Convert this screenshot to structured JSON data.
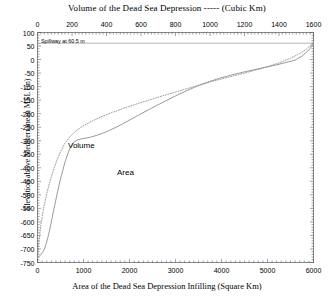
{
  "chart_data": {
    "type": "line",
    "title": "Volume of the Dead Sea Depression ----- (Cubic Km)",
    "xlabel_top": "Volume of the Dead Sea Depression ----- (Cubic Km)",
    "xlabel_bottom": "Area of the Dead Sea Depression Infilling (Square Km)",
    "ylabel": "Elevation above Mediterranean MSL (m)",
    "ylim": [
      -750,
      100
    ],
    "xlim_top": [
      0,
      1600
    ],
    "xlim_bottom": [
      0,
      6000
    ],
    "grid": false,
    "legend_position": "inline-annotations",
    "yticks": [
      100,
      50,
      0,
      -50,
      -100,
      -150,
      -200,
      -250,
      -300,
      -350,
      -400,
      -450,
      -500,
      -550,
      -600,
      -650,
      -700,
      -750
    ],
    "ytick_labels": [
      "100",
      "50",
      "0",
      "-50",
      "-100",
      "-150",
      "-200",
      "-250",
      "-300",
      "-350",
      "-400",
      "-450",
      "-500",
      "-550",
      "-600",
      "-650",
      "-700",
      "-750"
    ],
    "xticks_top": [
      0,
      200,
      400,
      600,
      800,
      1000,
      1200,
      1400,
      1600
    ],
    "xtick_labels_top": [
      "0",
      "200",
      "400",
      "600",
      "800",
      "1000",
      "1200",
      "1400",
      "1600"
    ],
    "xticks_bottom": [
      0,
      1000,
      2000,
      3000,
      4000,
      5000,
      6000
    ],
    "xtick_labels_bottom": [
      "0",
      "1000",
      "2000",
      "3000",
      "4000",
      "5000",
      "6000"
    ],
    "annotations": [
      {
        "name": "spillway-line",
        "text": "Spillway at 60.5 m",
        "elevation": 60.5,
        "style": "horizontal-line"
      }
    ],
    "series": [
      {
        "name": "Volume",
        "label": "Volume",
        "style": "dotted",
        "color": "#808080",
        "x_axis": "top",
        "x_units": "Cubic Km",
        "points": [
          [
            0,
            -730
          ],
          [
            2,
            -720
          ],
          [
            5,
            -700
          ],
          [
            9,
            -670
          ],
          [
            14,
            -640
          ],
          [
            20,
            -610
          ],
          [
            27,
            -580
          ],
          [
            35,
            -550
          ],
          [
            45,
            -520
          ],
          [
            56,
            -490
          ],
          [
            68,
            -460
          ],
          [
            82,
            -430
          ],
          [
            97,
            -400
          ],
          [
            114,
            -370
          ],
          [
            134,
            -340
          ],
          [
            158,
            -310
          ],
          [
            188,
            -285
          ],
          [
            225,
            -262
          ],
          [
            270,
            -243
          ],
          [
            320,
            -226
          ],
          [
            375,
            -210
          ],
          [
            435,
            -195
          ],
          [
            500,
            -180
          ],
          [
            570,
            -165
          ],
          [
            645,
            -150
          ],
          [
            720,
            -135
          ],
          [
            800,
            -120
          ],
          [
            880,
            -105
          ],
          [
            960,
            -90
          ],
          [
            1040,
            -76
          ],
          [
            1120,
            -63
          ],
          [
            1200,
            -50
          ],
          [
            1275,
            -37
          ],
          [
            1345,
            -24
          ],
          [
            1410,
            -10
          ],
          [
            1470,
            6
          ],
          [
            1520,
            22
          ],
          [
            1558,
            38
          ],
          [
            1582,
            52
          ],
          [
            1596,
            60.5
          ]
        ]
      },
      {
        "name": "Area",
        "label": "Area",
        "style": "solid",
        "color": "#808080",
        "x_axis": "bottom",
        "x_units": "Square Km",
        "points": [
          [
            0,
            -730
          ],
          [
            30,
            -728
          ],
          [
            70,
            -722
          ],
          [
            110,
            -712
          ],
          [
            150,
            -700
          ],
          [
            190,
            -680
          ],
          [
            230,
            -655
          ],
          [
            270,
            -625
          ],
          [
            310,
            -592
          ],
          [
            350,
            -558
          ],
          [
            395,
            -522
          ],
          [
            440,
            -485
          ],
          [
            490,
            -448
          ],
          [
            545,
            -412
          ],
          [
            600,
            -378
          ],
          [
            660,
            -348
          ],
          [
            720,
            -322
          ],
          [
            790,
            -305
          ],
          [
            870,
            -297
          ],
          [
            960,
            -293
          ],
          [
            1060,
            -290
          ],
          [
            1170,
            -286
          ],
          [
            1290,
            -280
          ],
          [
            1420,
            -272
          ],
          [
            1560,
            -262
          ],
          [
            1710,
            -250
          ],
          [
            1870,
            -236
          ],
          [
            2040,
            -220
          ],
          [
            2220,
            -203
          ],
          [
            2410,
            -186
          ],
          [
            2610,
            -168
          ],
          [
            2820,
            -150
          ],
          [
            3040,
            -131
          ],
          [
            3270,
            -113
          ],
          [
            3500,
            -96
          ],
          [
            3740,
            -81
          ],
          [
            3980,
            -68
          ],
          [
            4220,
            -57
          ],
          [
            4460,
            -47
          ],
          [
            4700,
            -38
          ],
          [
            4940,
            -29
          ],
          [
            5180,
            -20
          ],
          [
            5400,
            -11
          ],
          [
            5600,
            -2
          ],
          [
            5760,
            14
          ],
          [
            5880,
            32
          ],
          [
            5960,
            48
          ],
          [
            6000,
            60.5
          ]
        ]
      }
    ]
  },
  "labels": {
    "volume_curve": "Volume",
    "area_curve": "Area",
    "spillway_note": "Spillway at 60.5 m"
  },
  "colors": {
    "axis": "#555555",
    "curve": "#888888",
    "text": "#000000",
    "background": "#ffffff"
  }
}
